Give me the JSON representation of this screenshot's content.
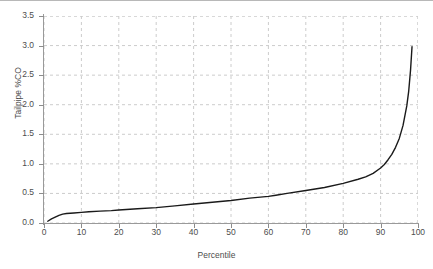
{
  "chart_data": {
    "type": "line",
    "title": "",
    "subtitle": "",
    "xlabel": "Percentile",
    "ylabel": "Tailpipe %CO",
    "xlim": [
      0,
      100
    ],
    "ylim": [
      0.0,
      3.5
    ],
    "xticks": [
      0,
      10,
      20,
      30,
      40,
      50,
      60,
      70,
      80,
      90,
      100
    ],
    "xtick_labels": [
      "0",
      "10",
      "20",
      "30",
      "40",
      "50",
      "60",
      "70",
      "80",
      "90",
      "100"
    ],
    "yticks": [
      0.0,
      0.5,
      1.0,
      1.5,
      2.0,
      2.5,
      3.0,
      3.5
    ],
    "ytick_labels": [
      "0.0",
      "0.5",
      "1.0",
      "1.5",
      "2.0",
      "2.5",
      "3.0",
      "3.5"
    ],
    "grid": true,
    "grid_style": "dashed",
    "grid_color": "#cccccc",
    "legend": false,
    "legend_position": "none",
    "line_color": "#1a1a1a",
    "line_width": 1.4,
    "series": [
      {
        "name": "Tailpipe %CO by percentile",
        "x": [
          1,
          2,
          3,
          4,
          5,
          6,
          8,
          10,
          12,
          15,
          18,
          20,
          25,
          30,
          35,
          40,
          45,
          50,
          55,
          60,
          62,
          65,
          70,
          75,
          80,
          84,
          86,
          88,
          90,
          91,
          92,
          93,
          94,
          95,
          96,
          97,
          97.5,
          98,
          98.4
        ],
        "y": [
          0.03,
          0.07,
          0.1,
          0.13,
          0.15,
          0.16,
          0.17,
          0.18,
          0.19,
          0.2,
          0.21,
          0.22,
          0.24,
          0.26,
          0.29,
          0.32,
          0.35,
          0.38,
          0.42,
          0.45,
          0.47,
          0.5,
          0.55,
          0.6,
          0.67,
          0.74,
          0.78,
          0.84,
          0.93,
          0.99,
          1.07,
          1.16,
          1.28,
          1.43,
          1.65,
          1.98,
          2.22,
          2.58,
          2.98
        ]
      }
    ]
  },
  "axes": {
    "y_title": "Tailpipe %CO",
    "x_title": "Percentile"
  }
}
